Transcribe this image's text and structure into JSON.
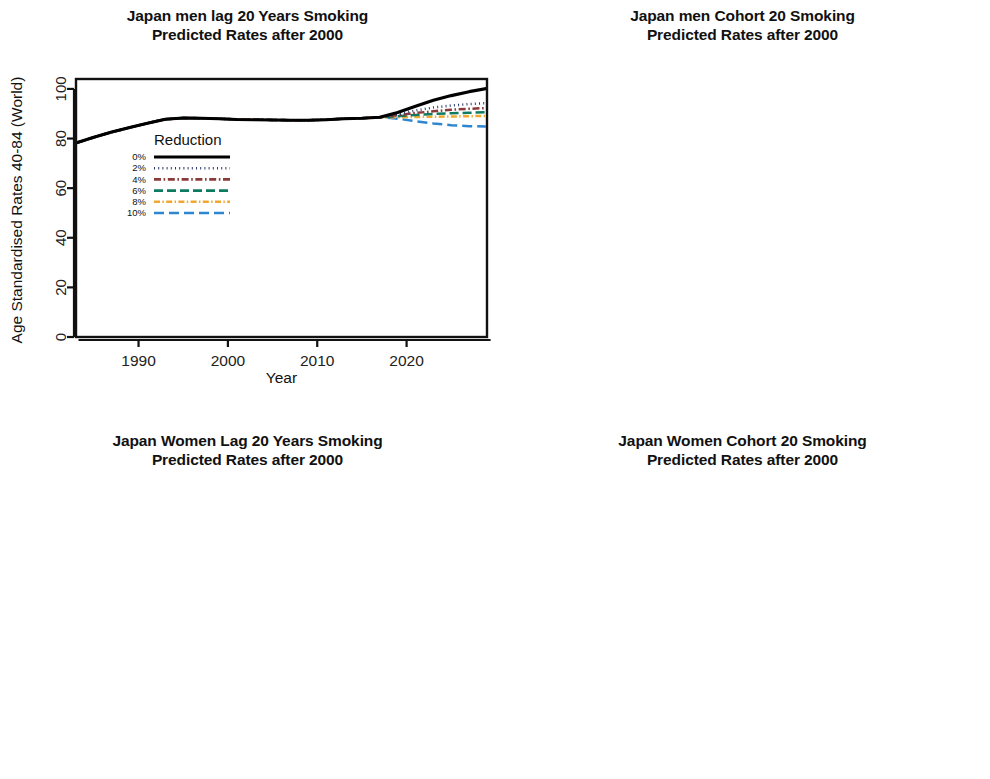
{
  "figure": {
    "axis_label_y": "Age Standardised Rates 40-84 (World)",
    "axis_label_y_clipped": "Age Standardised Rates 40-84 (Worlc",
    "axis_label_x": "Year",
    "legend_title": "Reduction"
  },
  "legend": {
    "title": "Reduction",
    "entries": [
      {
        "label": "0%",
        "color": "#000000",
        "dash": "none"
      },
      {
        "label": "2%",
        "color": "#2b3a6b",
        "dash": "dotted"
      },
      {
        "label": "4%",
        "color": "#8b3a3a",
        "dash": "dashdot"
      },
      {
        "label": "6%",
        "color": "#0e7a5f",
        "dash": "dashed"
      },
      {
        "label": "8%",
        "color": "#f0a830",
        "dash": "dashdot2"
      },
      {
        "label": "10%",
        "color": "#2e86d1",
        "dash": "longdash"
      }
    ]
  },
  "chart_data": [
    {
      "id": "japan-men-lag-20",
      "type": "line",
      "title": "Japan men lag 20 Years Smoking",
      "subtitle": "Predicted Rates after 2000",
      "xlabel": "Year",
      "ylabel": "Age Standardised Rates 40-84 (World)",
      "xlim": [
        1983,
        2029
      ],
      "ylim": [
        0,
        104
      ],
      "xticks": [
        1990,
        2000,
        2010,
        2020
      ],
      "yticks": [
        0,
        20,
        40,
        60,
        80,
        100
      ],
      "grid": false,
      "legend_position": "center-left",
      "x": [
        1983,
        1985,
        1987,
        1989,
        1991,
        1993,
        1995,
        1997,
        1999,
        2001,
        2003,
        2005,
        2007,
        2009,
        2011,
        2013,
        2015,
        2017,
        2019,
        2021,
        2023,
        2025,
        2027,
        2029
      ],
      "series": [
        {
          "name": "0%",
          "values": [
            78.2,
            80.5,
            82.6,
            84.4,
            86.2,
            87.8,
            88.3,
            88.2,
            88.0,
            87.7,
            87.6,
            87.5,
            87.4,
            87.4,
            87.6,
            88.0,
            88.2,
            88.6,
            90.5,
            93.0,
            95.4,
            97.3,
            98.9,
            100.2
          ]
        },
        {
          "name": "2%",
          "values": [
            78.2,
            80.5,
            82.6,
            84.4,
            86.2,
            87.8,
            88.3,
            88.2,
            88.0,
            87.7,
            87.6,
            87.5,
            87.4,
            87.4,
            87.6,
            88.0,
            88.2,
            88.6,
            89.8,
            91.3,
            92.5,
            93.3,
            93.9,
            94.3
          ]
        },
        {
          "name": "4%",
          "values": [
            78.2,
            80.5,
            82.6,
            84.4,
            86.2,
            87.8,
            88.3,
            88.2,
            88.0,
            87.7,
            87.6,
            87.5,
            87.4,
            87.4,
            87.6,
            88.0,
            88.2,
            88.6,
            89.4,
            90.3,
            91.0,
            91.6,
            92.0,
            92.3
          ]
        },
        {
          "name": "6%",
          "values": [
            78.2,
            80.5,
            82.6,
            84.4,
            86.2,
            87.8,
            88.3,
            88.2,
            88.0,
            87.7,
            87.6,
            87.5,
            87.4,
            87.4,
            87.6,
            88.0,
            88.2,
            88.6,
            89.0,
            89.5,
            89.9,
            90.2,
            90.4,
            90.6
          ]
        },
        {
          "name": "8%",
          "values": [
            78.2,
            80.5,
            82.6,
            84.4,
            86.2,
            87.8,
            88.3,
            88.2,
            88.0,
            87.7,
            87.6,
            87.5,
            87.4,
            87.4,
            87.6,
            88.0,
            88.2,
            88.6,
            88.6,
            88.7,
            88.8,
            88.9,
            89.0,
            89.1
          ]
        },
        {
          "name": "10%",
          "values": [
            78.2,
            80.5,
            82.6,
            84.4,
            86.2,
            87.8,
            88.3,
            88.2,
            88.0,
            87.7,
            87.6,
            87.5,
            87.4,
            87.4,
            87.6,
            88.0,
            88.2,
            88.6,
            88.0,
            87.0,
            86.1,
            85.4,
            85.0,
            84.8
          ]
        }
      ]
    },
    {
      "id": "japan-men-cohort-20",
      "type": "line",
      "title": "Japan men Cohort 20 Smoking",
      "subtitle": "Predicted Rates after 2000",
      "xlabel": "Year",
      "ylabel": "Age Standardised Rates 40-84 (Worlc",
      "xlim": [
        1983,
        2029
      ],
      "ylim": [
        0,
        104
      ],
      "xticks": [
        1990,
        2000,
        2010,
        2020
      ],
      "yticks": [
        0,
        20,
        40,
        60,
        80,
        100
      ],
      "grid": false,
      "legend_position": "center",
      "x": [
        1983,
        1985,
        1987,
        1989,
        1991,
        1993,
        1995,
        1997,
        1999,
        2001,
        2003,
        2005,
        2007,
        2009,
        2011,
        2013,
        2015,
        2017,
        2019,
        2021,
        2023,
        2025,
        2027,
        2029
      ],
      "series": [
        {
          "name": "0%",
          "values": [
            78.5,
            80.8,
            83.0,
            85.0,
            86.9,
            88.2,
            88.3,
            88.5,
            88.6,
            89.3,
            90.2,
            91.1,
            92.0,
            93.0,
            94.0,
            95.2,
            96.3,
            97.3,
            98.2,
            99.0,
            99.5,
            99.8,
            99.9,
            100.0
          ]
        },
        {
          "name": "2%",
          "values": [
            78.5,
            80.8,
            83.0,
            85.0,
            86.9,
            88.2,
            88.3,
            88.5,
            88.6,
            89.3,
            90.2,
            91.1,
            92.0,
            93.0,
            94.0,
            95.2,
            96.3,
            97.3,
            98.1,
            98.9,
            99.4,
            99.7,
            99.8,
            99.9
          ]
        },
        {
          "name": "4%",
          "values": [
            78.5,
            80.8,
            83.0,
            85.0,
            86.9,
            88.2,
            88.3,
            88.5,
            88.6,
            89.3,
            90.2,
            91.1,
            92.0,
            93.0,
            94.0,
            95.2,
            96.3,
            97.2,
            98.0,
            98.8,
            99.3,
            99.6,
            99.7,
            99.8
          ]
        },
        {
          "name": "6%",
          "values": [
            78.5,
            80.8,
            83.0,
            85.0,
            86.9,
            88.2,
            88.3,
            88.5,
            88.6,
            89.3,
            90.2,
            91.1,
            92.0,
            93.0,
            94.0,
            95.1,
            96.2,
            97.1,
            97.9,
            98.7,
            99.2,
            99.5,
            99.6,
            99.7
          ]
        },
        {
          "name": "8%",
          "values": [
            78.5,
            80.8,
            83.0,
            85.0,
            86.9,
            88.2,
            88.3,
            88.5,
            88.6,
            89.3,
            90.2,
            91.1,
            92.0,
            92.9,
            93.9,
            95.0,
            96.1,
            97.0,
            97.8,
            98.6,
            99.1,
            99.4,
            99.5,
            99.6
          ]
        },
        {
          "name": "10%",
          "values": [
            78.5,
            80.8,
            83.0,
            85.0,
            86.9,
            88.2,
            88.3,
            88.5,
            88.6,
            89.3,
            90.2,
            91.0,
            91.9,
            92.9,
            93.8,
            94.9,
            96.0,
            96.9,
            97.7,
            98.5,
            99.0,
            99.3,
            99.4,
            99.5
          ]
        }
      ]
    },
    {
      "id": "japan-women-lag-20",
      "type": "line",
      "title": "Japan Women Lag 20 Years Smoking",
      "subtitle": "Predicted Rates after 2000",
      "xlabel": "Year",
      "ylabel": "Age Standardised Rates 40-84 (World)",
      "xlim": [
        1983,
        2029
      ],
      "ylim": [
        0,
        31
      ],
      "xticks": [
        1990,
        2000,
        2010,
        2020
      ],
      "yticks": [
        0,
        5,
        10,
        15,
        20,
        25,
        30
      ],
      "grid": false,
      "legend_position": "center-left",
      "x": [
        1983,
        1985,
        1987,
        1989,
        1991,
        1993,
        1995,
        1997,
        1999,
        2001,
        2003,
        2005,
        2007,
        2009,
        2011,
        2013,
        2015,
        2017,
        2019,
        2021,
        2023,
        2025,
        2027,
        2029
      ],
      "series": [
        {
          "name": "0%",
          "values": [
            21.5,
            21.8,
            22.1,
            22.4,
            22.7,
            23.0,
            23.2,
            23.2,
            23.3,
            23.8,
            24.4,
            25.1,
            25.8,
            26.5,
            27.3,
            28.1,
            28.8,
            29.3,
            29.1,
            28.8,
            28.6,
            28.4,
            28.3,
            28.2
          ]
        },
        {
          "name": "2%",
          "values": [
            21.5,
            21.8,
            22.1,
            22.4,
            22.7,
            23.0,
            23.2,
            23.2,
            23.3,
            23.8,
            24.4,
            25.1,
            25.8,
            26.5,
            27.3,
            28.1,
            28.8,
            29.3,
            28.9,
            28.4,
            28.0,
            27.7,
            27.5,
            27.4
          ]
        },
        {
          "name": "4%",
          "values": [
            21.5,
            21.8,
            22.1,
            22.4,
            22.7,
            23.0,
            23.2,
            23.2,
            23.3,
            23.8,
            24.4,
            25.1,
            25.8,
            26.5,
            27.3,
            28.1,
            28.8,
            29.3,
            28.8,
            28.1,
            27.6,
            27.2,
            26.9,
            26.7
          ]
        },
        {
          "name": "6%",
          "values": [
            21.5,
            21.8,
            22.1,
            22.4,
            22.7,
            23.0,
            23.2,
            23.2,
            23.3,
            23.8,
            24.4,
            25.1,
            25.8,
            26.5,
            27.3,
            28.1,
            28.8,
            29.3,
            28.6,
            27.8,
            27.1,
            26.6,
            26.2,
            26.0
          ]
        },
        {
          "name": "8%",
          "values": [
            21.5,
            21.8,
            22.1,
            22.4,
            22.7,
            23.0,
            23.2,
            23.2,
            23.3,
            23.8,
            24.4,
            25.1,
            25.8,
            26.5,
            27.3,
            28.1,
            28.8,
            29.3,
            28.5,
            27.5,
            26.7,
            26.1,
            25.6,
            25.3
          ]
        },
        {
          "name": "10%",
          "values": [
            21.5,
            21.8,
            22.1,
            22.4,
            22.7,
            23.0,
            23.2,
            23.2,
            23.3,
            23.8,
            24.4,
            25.1,
            25.8,
            26.5,
            27.3,
            28.1,
            28.8,
            29.3,
            28.3,
            27.1,
            26.1,
            25.3,
            24.7,
            24.3
          ]
        }
      ]
    },
    {
      "id": "japan-women-cohort-20",
      "type": "line",
      "title": "Japan Women Cohort 20 Smoking",
      "subtitle": "Predicted Rates after 2000",
      "xlabel": "Year",
      "ylabel": "Age Standardised Rates 40-84 (Worlc",
      "xlim": [
        1983,
        2029
      ],
      "ylim": [
        0,
        24.5
      ],
      "xticks": [
        1990,
        2000,
        2010,
        2020
      ],
      "yticks": [
        0,
        5,
        10,
        15,
        20
      ],
      "grid": false,
      "legend_position": "center-left",
      "x": [
        1983,
        1985,
        1987,
        1989,
        1991,
        1993,
        1995,
        1997,
        1999,
        2001,
        2003,
        2005,
        2007,
        2009,
        2011,
        2013,
        2015,
        2017,
        2019,
        2021,
        2023,
        2025,
        2027,
        2029
      ],
      "series": [
        {
          "name": "0%",
          "values": [
            21.5,
            21.8,
            22.1,
            22.4,
            22.7,
            23.0,
            23.1,
            23.2,
            23.2,
            23.3,
            23.3,
            23.2,
            23.1,
            23.0,
            22.9,
            22.8,
            22.7,
            22.6,
            22.5,
            22.4,
            22.3,
            22.3,
            22.3,
            22.3
          ]
        },
        {
          "name": "2%",
          "values": [
            21.5,
            21.8,
            22.1,
            22.4,
            22.7,
            23.0,
            23.1,
            23.2,
            23.2,
            23.3,
            23.3,
            23.2,
            23.1,
            23.0,
            22.9,
            22.8,
            22.7,
            22.6,
            22.5,
            22.4,
            22.3,
            22.3,
            22.3,
            22.3
          ]
        },
        {
          "name": "4%",
          "values": [
            21.5,
            21.8,
            22.1,
            22.4,
            22.7,
            23.0,
            23.1,
            23.2,
            23.2,
            23.3,
            23.3,
            23.2,
            23.1,
            23.0,
            22.9,
            22.8,
            22.7,
            22.6,
            22.5,
            22.4,
            22.3,
            22.2,
            22.2,
            22.2
          ]
        },
        {
          "name": "6%",
          "values": [
            21.5,
            21.8,
            22.1,
            22.4,
            22.7,
            23.0,
            23.1,
            23.2,
            23.2,
            23.3,
            23.3,
            23.2,
            23.1,
            23.0,
            22.9,
            22.8,
            22.7,
            22.6,
            22.4,
            22.3,
            22.2,
            22.2,
            22.2,
            22.2
          ]
        },
        {
          "name": "8%",
          "values": [
            21.5,
            21.8,
            22.1,
            22.4,
            22.7,
            23.0,
            23.1,
            23.2,
            23.2,
            23.3,
            23.3,
            23.2,
            23.1,
            23.0,
            22.8,
            22.7,
            22.6,
            22.5,
            22.4,
            22.3,
            22.2,
            22.1,
            22.1,
            22.1
          ]
        },
        {
          "name": "10%",
          "values": [
            21.5,
            21.8,
            22.1,
            22.4,
            22.7,
            23.0,
            23.1,
            23.2,
            23.2,
            23.2,
            23.2,
            23.1,
            23.0,
            22.9,
            22.8,
            22.7,
            22.6,
            22.5,
            22.3,
            22.2,
            22.1,
            22.1,
            22.1,
            22.1
          ]
        }
      ]
    }
  ]
}
